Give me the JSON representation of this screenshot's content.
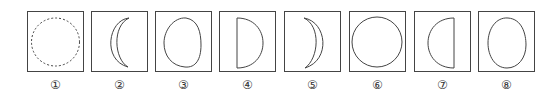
{
  "figure": {
    "panels": [
      {
        "label": "①",
        "shape": "dashed-circle"
      },
      {
        "label": "②",
        "shape": "crescent-left"
      },
      {
        "label": "③",
        "shape": "oval-bulging"
      },
      {
        "label": "④",
        "shape": "half-circle-right"
      },
      {
        "label": "⑤",
        "shape": "crescent-right"
      },
      {
        "label": "⑥",
        "shape": "full-circle"
      },
      {
        "label": "⑦",
        "shape": "half-circle-left"
      },
      {
        "label": "⑧",
        "shape": "oval"
      }
    ],
    "colors": {
      "stroke": "#444444",
      "border": "#444444",
      "background": "#ffffff"
    }
  }
}
